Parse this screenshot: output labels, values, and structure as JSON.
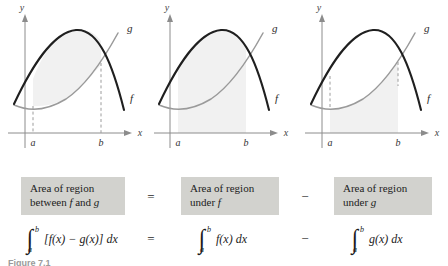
{
  "figure": {
    "bottom_caption": "Figure 7.1"
  },
  "panels": [
    {
      "id": "panel-between",
      "y_axis_label": "y",
      "x_axis_label": "x",
      "curve_f_label": "f",
      "curve_g_label": "g",
      "lower_bound_label": "a",
      "upper_bound_label": "b",
      "shading": "between f and g",
      "has_dashed_bounds": true
    },
    {
      "id": "panel-under-f",
      "y_axis_label": "y",
      "x_axis_label": "x",
      "curve_f_label": "f",
      "curve_g_label": "g",
      "lower_bound_label": "a",
      "upper_bound_label": "b",
      "shading": "under f",
      "has_dashed_bounds": false
    },
    {
      "id": "panel-under-g",
      "y_axis_label": "y",
      "x_axis_label": "x",
      "curve_f_label": "f",
      "curve_g_label": "g",
      "lower_bound_label": "a",
      "upper_bound_label": "b",
      "shading": "under g",
      "has_dashed_bounds": true
    }
  ],
  "captions": [
    {
      "line1": "Area of region",
      "line2_pre": "between ",
      "line2_f": "f",
      "line2_mid": " and ",
      "line2_g": "g",
      "line2_post": ""
    },
    {
      "line1": "Area of region",
      "line2_pre": "under ",
      "line2_f": "f",
      "line2_mid": "",
      "line2_g": "",
      "line2_post": ""
    },
    {
      "line1": "Area of region",
      "line2_pre": "under ",
      "line2_f": "",
      "line2_mid": "",
      "line2_g": "g",
      "line2_post": ""
    }
  ],
  "operators": {
    "equals": "=",
    "minus": "−"
  },
  "formulas": [
    {
      "id": "integral-difference",
      "lower_limit": "a",
      "upper_limit": "b",
      "integrand": "[f(x) − g(x)]",
      "differential": "dx"
    },
    {
      "id": "integral-f",
      "lower_limit": "a",
      "upper_limit": "b",
      "integrand": "f(x)",
      "differential": "dx"
    },
    {
      "id": "integral-g",
      "lower_limit": "a",
      "upper_limit": "b",
      "integrand": "g(x)",
      "differential": "dx"
    }
  ],
  "colors": {
    "shade_fill": "#f1f1f1",
    "caption_box": "#d2d2ce",
    "curve_f": "#1f1f1f",
    "curve_g": "#8a8a8a",
    "axis": "#8c8c8c",
    "page_background": "#ffffff"
  }
}
